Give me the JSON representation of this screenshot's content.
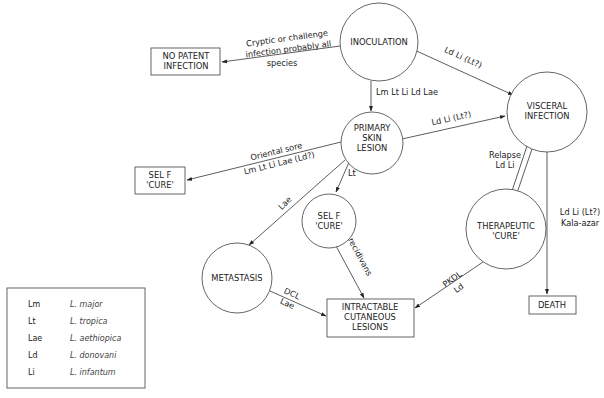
{
  "nodes": {
    "inoculation": {
      "label": [
        "INOCULATION"
      ],
      "shape": "circle"
    },
    "no_patent_infection": {
      "label": [
        "NO PATENT",
        "INFECTION"
      ],
      "shape": "box"
    },
    "visceral_infection": {
      "label": [
        "VISCERAL",
        "INFECTION"
      ],
      "shape": "circle"
    },
    "primary_skin_lesion": {
      "label": [
        "PRIMARY",
        "SKIN",
        "LESION"
      ],
      "shape": "circle"
    },
    "self_cure_box": {
      "label": [
        "SEL F",
        "'CURE'"
      ],
      "shape": "box"
    },
    "self_cure_circle": {
      "label": [
        "SEL F",
        "'CURE'"
      ],
      "shape": "circle"
    },
    "therapeutic_cure": {
      "label": [
        "THERAPEUTIC",
        "'CURE'"
      ],
      "shape": "circle"
    },
    "metastasis": {
      "label": [
        "METASTASIS"
      ],
      "shape": "circle"
    },
    "intractable_lesions": {
      "label": [
        "INTRACTABLE",
        "CUTANEOUS",
        "LESIONS"
      ],
      "shape": "box"
    },
    "death": {
      "label": [
        "DEATH"
      ],
      "shape": "box"
    }
  },
  "edges": [
    {
      "from": "inoculation",
      "to": "no_patent_infection",
      "label": [
        "Cryptic or challenge",
        "infection probably all",
        "species"
      ]
    },
    {
      "from": "inoculation",
      "to": "visceral_infection",
      "label": [
        "Ld Li (Lt?)"
      ]
    },
    {
      "from": "inoculation",
      "to": "primary_skin_lesion",
      "label": [
        "Lm Lt Li Ld Lae"
      ]
    },
    {
      "from": "primary_skin_lesion",
      "to": "visceral_infection",
      "label": [
        "Ld Li (Lt?)"
      ]
    },
    {
      "from": "primary_skin_lesion",
      "to": "self_cure_box",
      "label": [
        "Oriental sore",
        "Lm Lt Li Lae (Ld?)"
      ]
    },
    {
      "from": "primary_skin_lesion",
      "to": "self_cure_circle",
      "label": [
        "Lt"
      ]
    },
    {
      "from": "primary_skin_lesion",
      "to": "metastasis",
      "label": [
        "Lae"
      ]
    },
    {
      "from": "self_cure_circle",
      "to": "intractable_lesions",
      "label": [
        "L.recidivans"
      ]
    },
    {
      "from": "metastasis",
      "to": "intractable_lesions",
      "label": [
        "DCL",
        "Lae"
      ]
    },
    {
      "from": "therapeutic_cure",
      "to": "visceral_infection",
      "label": [
        "Relapse",
        "Ld Li"
      ]
    },
    {
      "from": "visceral_infection",
      "to": "therapeutic_cure",
      "label": []
    },
    {
      "from": "therapeutic_cure",
      "to": "intractable_lesions",
      "label": [
        "PKDL",
        "Ld"
      ]
    },
    {
      "from": "visceral_infection",
      "to": "death",
      "label": [
        "Ld Li (Lt?)",
        "Kala-azar"
      ]
    }
  ],
  "legend": [
    {
      "abbr": "Lm",
      "name": "L. major"
    },
    {
      "abbr": "Lt",
      "name": "L. tropica"
    },
    {
      "abbr": "Lae",
      "name": "L. aethiopica"
    },
    {
      "abbr": "Ld",
      "name": "L. donovani"
    },
    {
      "abbr": "Li",
      "name": "L. infantum"
    }
  ]
}
